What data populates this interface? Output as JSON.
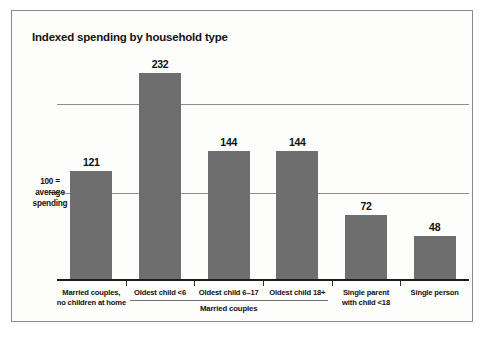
{
  "chart_data": {
    "type": "bar",
    "title": "Indexed spending by household type",
    "xlabel": "",
    "ylabel": "",
    "ylim": [
      0,
      240
    ],
    "grid": true,
    "gridlines": [
      100,
      200
    ],
    "legend": "none",
    "categories": [
      "Married couples,\nno children at home",
      "Oldest child <6",
      "Oldest child 6–17",
      "Oldest child 18+",
      "Single parent\nwith child <18",
      "Single person"
    ],
    "values": [
      121,
      232,
      144,
      144,
      72,
      48
    ],
    "annotations": {
      "baseline_note": "100 =\naverage\nspending",
      "group_bracket_label": "Married couples",
      "group_bracket_members": [
        "Oldest child <6",
        "Oldest child 6–17",
        "Oldest child 18+"
      ]
    },
    "colors": {
      "bar": "#6e6e6e",
      "gridline": "#8d8d8d",
      "axis": "#1b1b1b",
      "text": "#111111",
      "background": "#fdfdfb",
      "border": "#8a8a8a"
    }
  },
  "title": {
    "text": "Indexed spending by household type"
  },
  "axis": {
    "note_line1": "100 =",
    "note_line2": "average",
    "note_line3": "spending"
  },
  "categories": [
    {
      "line1": "Married couples,",
      "line2": "no children at home",
      "value": "121"
    },
    {
      "line1": "Oldest child <6",
      "line2": "",
      "value": "232"
    },
    {
      "line1": "Oldest child 6–17",
      "line2": "",
      "value": "144"
    },
    {
      "line1": "Oldest child 18+",
      "line2": "",
      "value": "144"
    },
    {
      "line1": "Single parent",
      "line2": "with child <18",
      "value": "72"
    },
    {
      "line1": "Single person",
      "line2": "",
      "value": "48"
    }
  ],
  "group": {
    "label": "Married couples"
  }
}
